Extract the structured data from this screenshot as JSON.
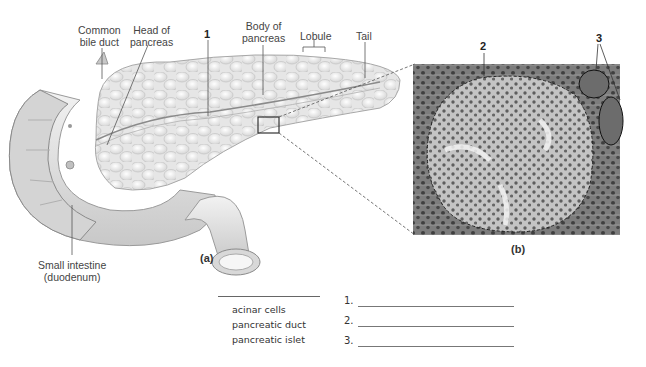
{
  "figure_a": {
    "caption": "(a)",
    "labels": {
      "common_bile_duct": [
        "Common",
        "bile duct"
      ],
      "head_of_pancreas": [
        "Head of",
        "pancreas"
      ],
      "number_1": "1",
      "body_of_pancreas": [
        "Body of",
        "pancreas"
      ],
      "lobule": "Lobule",
      "tail": "Tail",
      "small_intestine": [
        "Small intestine",
        "(duodenum)"
      ]
    }
  },
  "figure_b": {
    "caption": "(b)",
    "labels": {
      "number_2": "2",
      "number_3": "3"
    }
  },
  "terms": {
    "items": [
      "acinar cells",
      "pancreatic duct",
      "pancreatic islet"
    ]
  },
  "answers": [
    {
      "num": "1.",
      "value": ""
    },
    {
      "num": "2.",
      "value": ""
    },
    {
      "num": "3.",
      "value": ""
    }
  ],
  "colors": {
    "micrograph_bg": "#8a8a8a",
    "islet": "#c9c9c9",
    "organ": "#eeeeee"
  }
}
